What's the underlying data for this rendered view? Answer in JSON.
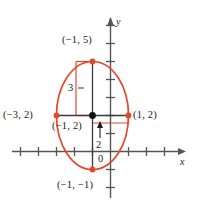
{
  "figure": {
    "axes": {
      "x_axis_label": "x",
      "y_axis_label": "y",
      "origin_label": "0",
      "axis_color": "#555555",
      "tick_count_x_right": 4,
      "tick_count_x_left": 3,
      "tick_count_y_up": 5,
      "tick_count_y_down": 2
    },
    "curve": {
      "type": "ellipse",
      "color": "#e8452c",
      "center": [
        -1,
        2
      ],
      "semi_axis_vertical": 3,
      "semi_axis_horizontal": 2,
      "equation": "(x+1)^2/4 + (y-2)^2/9 = 1"
    },
    "points": [
      {
        "name": "top-vertex",
        "label": "(−1, 5)",
        "x": -1,
        "y": 5,
        "color": "#e8452c"
      },
      {
        "name": "bottom-vertex",
        "label": "(−1, −1)",
        "x": -1,
        "y": -1,
        "color": "#e8452c"
      },
      {
        "name": "left-vertex",
        "label": "(−3, 2)",
        "x": -3,
        "y": 2,
        "color": "#e8452c"
      },
      {
        "name": "right-vertex",
        "label": "(1, 2)",
        "x": 1,
        "y": 2,
        "color": "#e8452c"
      },
      {
        "name": "center-point",
        "label": "(−1, 2)",
        "x": -1,
        "y": 2,
        "color": "#000000"
      }
    ],
    "measurements": [
      {
        "name": "semi-major-measure",
        "label": "3",
        "orientation": "vertical"
      },
      {
        "name": "semi-minor-measure",
        "label": "2",
        "orientation": "vertical-arrow"
      }
    ]
  }
}
